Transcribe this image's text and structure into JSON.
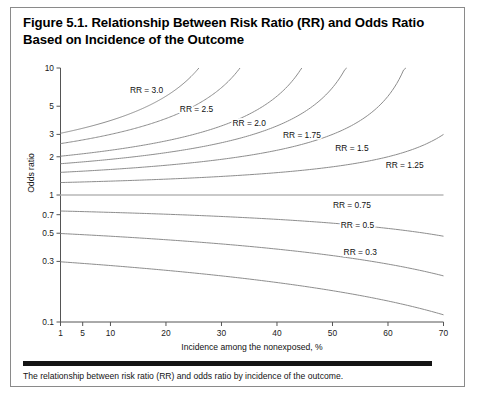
{
  "figure": {
    "title": "Figure 5.1. Relationship Between Risk Ratio (RR) and Odds Ratio Based on Incidence of the Outcome",
    "caption": "The relationship between risk ratio (RR) and odds ratio by incidence of the outcome."
  },
  "chart_data": {
    "type": "line",
    "title": "Figure 5.1. Relationship Between Risk Ratio (RR) and Odds Ratio Based on Incidence of the Outcome",
    "xlabel": "Incidence among the nonexposed, %",
    "ylabel": "Odds ratio",
    "xscale": "linear",
    "yscale": "log",
    "xlim": [
      1,
      70
    ],
    "ylim": [
      0.1,
      10
    ],
    "grid": false,
    "legend": "inline-curve-labels",
    "xticks": [
      1,
      5,
      10,
      20,
      30,
      40,
      50,
      60,
      70
    ],
    "xticklabels": [
      "1",
      "5",
      "10",
      "20",
      "30",
      "40",
      "50",
      "60",
      "70"
    ],
    "yticks": [
      0.1,
      0.3,
      0.5,
      0.7,
      1,
      2,
      3,
      5,
      10
    ],
    "yticklabels": [
      "0.1",
      "0.3",
      "0.5",
      "0.7",
      "1",
      "2",
      "3",
      "5",
      "10"
    ],
    "formula": "OR = RR * (1 - p0) / (1 - RR * p0)",
    "series": [
      {
        "name": "RR = 3.0",
        "rr": 3.0,
        "label": "RR = 3.0",
        "label_x": 16.5,
        "label_y": 6.35,
        "x_end": 29.5,
        "x": [
          1,
          5,
          10,
          15,
          20,
          25,
          29.5
        ],
        "y": [
          3.06,
          3.4,
          3.86,
          4.45,
          5.25,
          6.43,
          8.13
        ]
      },
      {
        "name": "RR = 2.5",
        "rr": 2.5,
        "label": "RR = 2.5",
        "label_x": 25.5,
        "label_y": 4.5,
        "x_end": 38.5,
        "x": [
          1,
          5,
          10,
          15,
          20,
          25,
          30,
          35,
          38.5
        ],
        "y": [
          2.54,
          2.71,
          2.95,
          3.24,
          3.6,
          4.06,
          4.64,
          5.43,
          6.15
        ]
      },
      {
        "name": "RR = 2.0",
        "rr": 2.0,
        "label": "RR = 2.0",
        "label_x": 35.0,
        "label_y": 3.52,
        "x_end": 48.0,
        "x": [
          1,
          5,
          10,
          15,
          20,
          25,
          30,
          35,
          40,
          45,
          48
        ],
        "y": [
          2.02,
          2.11,
          2.25,
          2.4,
          2.57,
          2.8,
          3.06,
          3.39,
          3.81,
          4.37,
          4.8
        ]
      },
      {
        "name": "RR = 1.75",
        "rr": 1.75,
        "label": "RR = 1.75",
        "label_x": 44.5,
        "label_y": 2.8,
        "x_end": 56.0,
        "x": [
          1,
          10,
          20,
          30,
          40,
          50,
          56
        ],
        "y": [
          1.76,
          1.91,
          2.1,
          2.34,
          2.65,
          3.07,
          3.4
        ]
      },
      {
        "name": "RR = 1.5",
        "rr": 1.5,
        "label": "RR = 1.5",
        "label_x": 53.5,
        "label_y": 2.22,
        "x_end": 66.5,
        "x": [
          1,
          10,
          20,
          30,
          40,
          50,
          60,
          66.5
        ],
        "y": [
          1.51,
          1.59,
          1.69,
          1.82,
          1.97,
          2.14,
          2.37,
          2.54
        ]
      },
      {
        "name": "RR = 1.25",
        "rr": 1.25,
        "label": "RR = 1.25",
        "label_x": 63.0,
        "label_y": 1.62,
        "x_end": 70.0,
        "x": [
          1,
          10,
          20,
          30,
          40,
          50,
          60,
          70
        ],
        "y": [
          1.25,
          1.29,
          1.33,
          1.38,
          1.43,
          1.5,
          1.56,
          1.64
        ]
      },
      {
        "name": "RR = 1.0",
        "rr": 1.0,
        "label": "",
        "label_x": null,
        "label_y": null,
        "x_end": 70.0,
        "x": [
          1,
          70
        ],
        "y": [
          1.0,
          1.0
        ]
      },
      {
        "name": "RR = 0.75",
        "rr": 0.75,
        "label": "RR = 0.75",
        "label_x": 53.5,
        "label_y": 0.79,
        "x_end": 70.0,
        "x": [
          1,
          10,
          20,
          30,
          40,
          50,
          60,
          70
        ],
        "y": [
          0.748,
          0.73,
          0.711,
          0.69,
          0.67,
          0.648,
          0.627,
          0.605
        ]
      },
      {
        "name": "RR = 0.5",
        "rr": 0.5,
        "label": "RR = 0.5",
        "label_x": 54.5,
        "label_y": 0.545,
        "x_end": 70.0,
        "x": [
          1,
          10,
          20,
          30,
          40,
          50,
          60,
          70
        ],
        "y": [
          0.497,
          0.474,
          0.444,
          0.412,
          0.375,
          0.333,
          0.286,
          0.231
        ]
      },
      {
        "name": "RR = 0.3",
        "rr": 0.3,
        "label": "RR = 0.3",
        "label_x": 55.0,
        "label_y": 0.335,
        "x_end": 70.0,
        "x": [
          1,
          10,
          20,
          30,
          40,
          50,
          60,
          70
        ],
        "y": [
          0.298,
          0.283,
          0.264,
          0.244,
          0.222,
          0.197,
          0.171,
          0.141
        ]
      }
    ]
  },
  "axes": {
    "x_title": "Incidence among the nonexposed, %",
    "y_title": "Odds ratio"
  },
  "colors": {
    "curve": "#8d8d8d",
    "unity_curve": "#c9c9c9",
    "axis": "#555555",
    "text": "#111111",
    "rule": "#141414",
    "frame": "#8a8a8a"
  }
}
